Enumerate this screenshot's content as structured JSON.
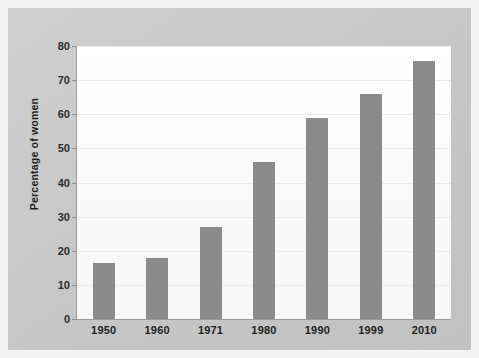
{
  "chart_data": {
    "type": "bar",
    "title": "",
    "subtitle": "",
    "xlabel": "",
    "ylabel": "Percentage of women",
    "categories": [
      "1950",
      "1960",
      "1971",
      "1980",
      "1990",
      "1999",
      "2010"
    ],
    "values": [
      16.5,
      18,
      27,
      46,
      59,
      66,
      75.5
    ],
    "series": [
      {
        "name": "Percentage of women",
        "values": [
          16.5,
          18,
          27,
          46,
          59,
          66,
          75.5
        ]
      }
    ],
    "ylim": [
      0,
      80
    ],
    "y_ticks": [
      0,
      10,
      20,
      30,
      40,
      50,
      60,
      70,
      80
    ],
    "y_tick_labels": [
      "0",
      "10",
      "20",
      "30",
      "40",
      "50",
      "60",
      "70",
      "80"
    ],
    "grid": true,
    "grid_axis": "y",
    "legend": false,
    "legend_position": "none",
    "annotations": [],
    "colors": {
      "bar": "#8b8b8b",
      "plot_background": "#fdfdfd",
      "figure_background": "#c9c9c9",
      "page_background": "#f4f4f4",
      "axis": "#9b9b9b",
      "gridline": "#eceaea",
      "text": "#1f1f1f"
    }
  }
}
